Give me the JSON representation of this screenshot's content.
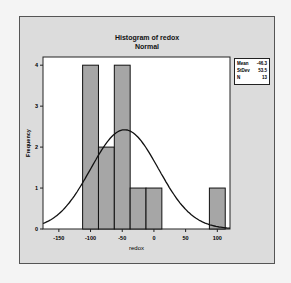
{
  "chart_data": {
    "type": "bar",
    "title": "Histogram of redox",
    "subtitle": "Normal",
    "xlabel": "redox",
    "ylabel": "Frequency",
    "x_ticks": [
      "-150",
      "-100",
      "-50",
      "0",
      "50",
      "100"
    ],
    "y_ticks": [
      "0",
      "1",
      "2",
      "3",
      "4"
    ],
    "bin_width": 25,
    "bins": [
      {
        "center": -100,
        "count": 4
      },
      {
        "center": -75,
        "count": 2
      },
      {
        "center": -50,
        "count": 4
      },
      {
        "center": -25,
        "count": 1
      },
      {
        "center": 0,
        "count": 1
      },
      {
        "center": 25,
        "count": 0
      },
      {
        "center": 50,
        "count": 0
      },
      {
        "center": 75,
        "count": 0
      },
      {
        "center": 100,
        "count": 1
      }
    ],
    "categories": [
      "-100",
      "-75",
      "-50",
      "-25",
      "0",
      "25",
      "50",
      "75",
      "100"
    ],
    "values": [
      4,
      2,
      4,
      1,
      1,
      0,
      0,
      0,
      1
    ],
    "xlim": [
      -175,
      120
    ],
    "ylim": [
      0,
      4.2
    ],
    "fit": {
      "type": "normal",
      "mean": -46.3,
      "stdev": 53.5,
      "n": 13
    },
    "legend": [
      {
        "label": "Mean",
        "value": "-46.3"
      },
      {
        "label": "StDev",
        "value": "53.5"
      },
      {
        "label": "N",
        "value": "13"
      }
    ],
    "bar_color": "#a6a6a6",
    "grid": false
  }
}
